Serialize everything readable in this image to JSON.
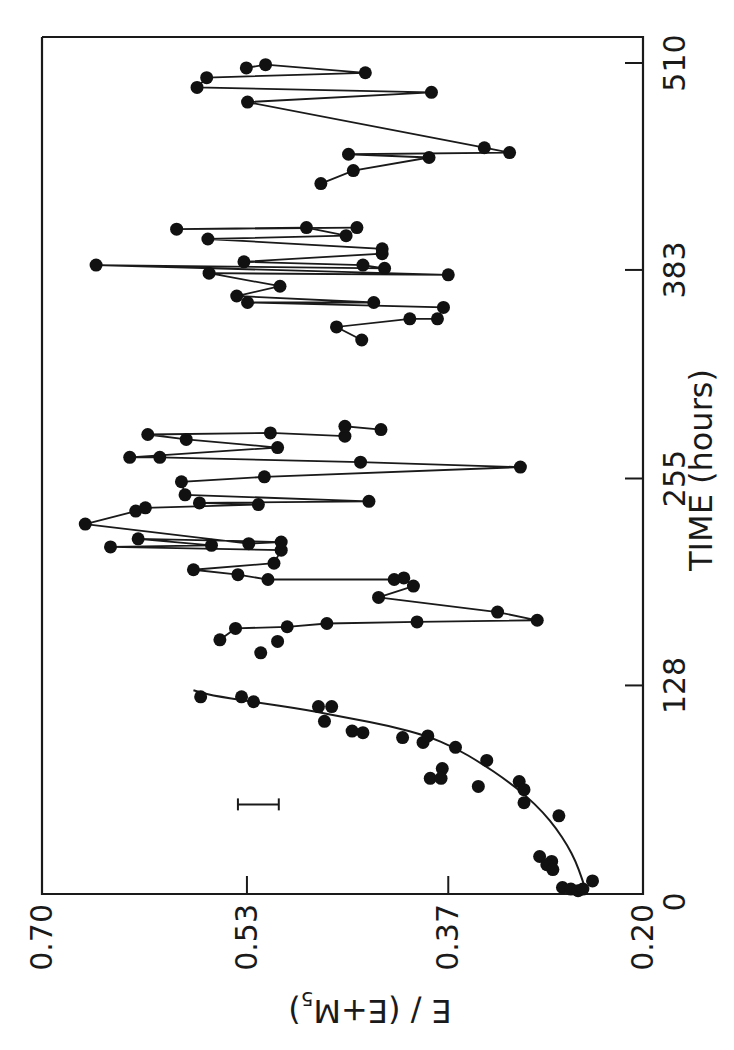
{
  "chart_data": {
    "type": "scatter",
    "orientation": "rotated-90-clockwise",
    "title": "",
    "xlabel": "TIME (hours)",
    "ylabel": "E / (E+M5)",
    "ylabel_parts": {
      "main": "E / (E+M",
      "sub": "5",
      "close": ")"
    },
    "xlim": [
      0,
      510
    ],
    "ylim": [
      0.2,
      0.7
    ],
    "x_ticks": [
      0,
      128,
      255,
      383,
      510
    ],
    "x_tick_labels": [
      "0",
      "128",
      "255",
      "383",
      "510"
    ],
    "y_ticks": [
      0.7,
      0.53,
      0.37,
      0.2
    ],
    "y_tick_labels": [
      "0.70",
      "0.53",
      "0.37",
      "0.20"
    ],
    "y_tick_positions_fraction": [
      0.0,
      0.341,
      0.676,
      1.0
    ],
    "grid": false,
    "legend": null,
    "error_bar": {
      "time": 55,
      "value_low": 0.503,
      "value_high": 0.537,
      "label": ""
    },
    "series": [
      {
        "name": "growth phase (points)",
        "style": "markers",
        "points": [
          [
            121,
            0.568
          ],
          [
            121,
            0.534
          ],
          [
            118,
            0.524
          ],
          [
            115,
            0.47
          ],
          [
            115,
            0.459
          ],
          [
            106,
            0.465
          ],
          [
            100,
            0.442
          ],
          [
            99,
            0.433
          ],
          [
            96,
            0.4
          ],
          [
            93,
            0.383
          ],
          [
            97,
            0.379
          ],
          [
            90,
            0.356
          ],
          [
            82,
            0.33
          ],
          [
            77,
            0.367
          ],
          [
            71,
            0.377
          ],
          [
            71,
            0.368
          ],
          [
            66,
            0.337
          ],
          [
            69,
            0.303
          ],
          [
            64,
            0.299
          ],
          [
            56,
            0.299
          ],
          [
            48,
            0.27
          ],
          [
            23,
            0.286
          ],
          [
            20,
            0.276
          ],
          [
            18,
            0.28
          ],
          [
            15,
            0.275
          ],
          [
            4,
            0.267
          ],
          [
            3,
            0.26
          ],
          [
            2,
            0.254
          ],
          [
            3,
            0.25
          ],
          [
            8,
            0.242
          ]
        ]
      },
      {
        "name": "growth phase (fitted curve)",
        "style": "smooth-line",
        "points": [
          [
            3,
            0.248
          ],
          [
            10,
            0.251
          ],
          [
            20,
            0.256
          ],
          [
            30,
            0.263
          ],
          [
            40,
            0.272
          ],
          [
            50,
            0.283
          ],
          [
            60,
            0.297
          ],
          [
            70,
            0.314
          ],
          [
            80,
            0.334
          ],
          [
            90,
            0.357
          ],
          [
            97,
            0.38
          ],
          [
            103,
            0.41
          ],
          [
            108,
            0.445
          ],
          [
            113,
            0.48
          ],
          [
            118,
            0.525
          ],
          [
            122,
            0.56
          ],
          [
            125,
            0.574
          ]
        ]
      },
      {
        "name": "isolated points",
        "style": "markers",
        "points": [
          [
            155,
            0.504
          ],
          [
            148,
            0.518
          ]
        ]
      },
      {
        "name": "segment 2 (140–300 h)",
        "style": "markers+line",
        "points": [
          [
            156,
            0.552
          ],
          [
            163,
            0.539
          ],
          [
            164,
            0.496
          ],
          [
            166,
            0.463
          ],
          [
            167,
            0.388
          ],
          [
            168,
            0.288
          ],
          [
            173,
            0.321
          ],
          [
            182,
            0.42
          ],
          [
            189,
            0.391
          ],
          [
            194,
            0.399
          ],
          [
            193,
            0.407
          ],
          [
            193,
            0.512
          ],
          [
            196,
            0.537
          ],
          [
            199,
            0.574
          ],
          [
            203,
            0.507
          ],
          [
            211,
            0.501
          ],
          [
            213,
            0.643
          ],
          [
            214,
            0.559
          ],
          [
            218,
            0.62
          ],
          [
            216,
            0.501
          ],
          [
            215,
            0.528
          ],
          [
            227,
            0.664
          ],
          [
            235,
            0.622
          ],
          [
            237,
            0.614
          ],
          [
            239,
            0.52
          ],
          [
            240,
            0.569
          ],
          [
            241,
            0.428
          ],
          [
            245,
            0.581
          ],
          [
            253,
            0.584
          ],
          [
            256,
            0.515
          ],
          [
            262,
            0.302
          ],
          [
            265,
            0.435
          ],
          [
            268,
            0.602
          ],
          [
            268,
            0.627
          ],
          [
            274,
            0.504
          ],
          [
            279,
            0.58
          ],
          [
            282,
            0.612
          ],
          [
            283,
            0.51
          ],
          [
            281,
            0.448
          ],
          [
            287,
            0.448
          ],
          [
            285,
            0.418
          ]
        ]
      },
      {
        "name": "segment 3 (340–400 h)",
        "style": "markers+line",
        "points": [
          [
            340,
            0.434
          ],
          [
            348,
            0.455
          ],
          [
            353,
            0.394
          ],
          [
            353,
            0.371
          ],
          [
            360,
            0.366
          ],
          [
            363,
            0.529
          ],
          [
            363,
            0.424
          ],
          [
            367,
            0.538
          ],
          [
            373,
            0.502
          ],
          [
            381,
            0.561
          ],
          [
            380,
            0.362
          ],
          [
            386,
            0.655
          ],
          [
            384,
            0.415
          ],
          [
            386,
            0.433
          ],
          [
            388,
            0.532
          ],
          [
            393,
            0.417
          ],
          [
            396,
            0.417
          ],
          [
            402,
            0.562
          ],
          [
            404,
            0.447
          ],
          [
            409,
            0.48
          ],
          [
            408,
            0.588
          ],
          [
            409,
            0.438
          ]
        ]
      },
      {
        "name": "segment 4 (420–510 h)",
        "style": "markers+line",
        "points": [
          [
            436,
            0.468
          ],
          [
            444,
            0.441
          ],
          [
            452,
            0.378
          ],
          [
            454,
            0.445
          ],
          [
            455,
            0.311
          ],
          [
            458,
            0.332
          ],
          [
            486,
            0.529
          ],
          [
            492,
            0.376
          ],
          [
            495,
            0.571
          ],
          [
            501,
            0.563
          ],
          [
            504,
            0.431
          ],
          [
            509,
            0.514
          ],
          [
            507,
            0.53
          ]
        ]
      }
    ]
  },
  "axes": {
    "value_axis_label": "E / (E+M5)",
    "time_axis_label": "TIME (hours)"
  }
}
